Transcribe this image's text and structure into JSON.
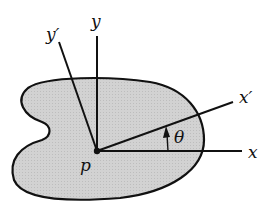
{
  "diagram": {
    "labels": {
      "y_prime": "y′",
      "y": "y",
      "x_prime": "x′",
      "x": "x",
      "theta": "θ",
      "p": "p"
    },
    "colors": {
      "region_fill": "#cfcfcf",
      "stroke": "#111111",
      "background": "#ffffff"
    },
    "origin": {
      "x": 97,
      "y": 151
    },
    "angle_theta_deg": 20
  }
}
